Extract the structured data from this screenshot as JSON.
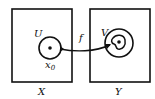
{
  "diagram": {
    "type": "mapping",
    "left_space": {
      "label": "X",
      "neighborhood_label": "U",
      "point_label": "x",
      "point_subscript": "0"
    },
    "right_space": {
      "label": "Y",
      "neighborhood_label": "V"
    },
    "map": {
      "label": "f",
      "from": "U",
      "to": "V"
    },
    "colors": {
      "stroke": "#111111",
      "background": "#ffffff"
    }
  }
}
